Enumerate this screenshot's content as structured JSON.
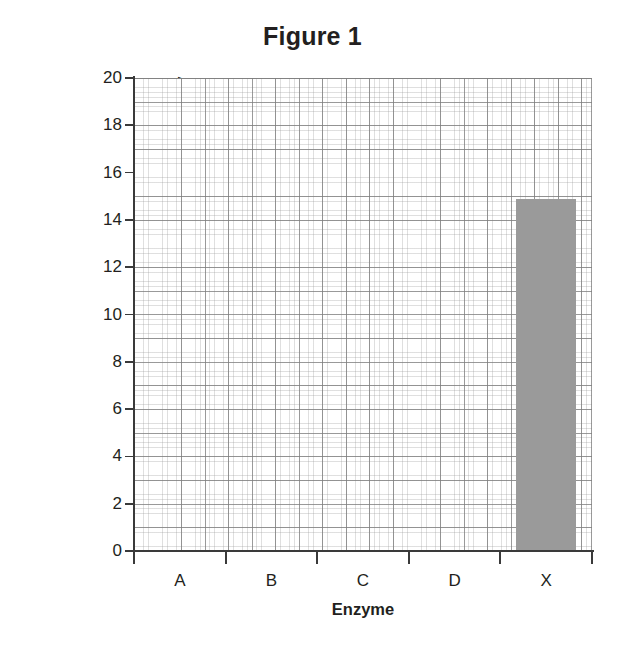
{
  "chart_data": {
    "type": "bar",
    "title": "Figure 1",
    "xlabel": "Enzyme",
    "ylabel": "Time Taken to Completely Digest Protein (min)",
    "ylabel_lines": [
      "Time Taken to Completely",
      "Digest Protein (min)"
    ],
    "categories": [
      "A",
      "B",
      "C",
      "D",
      "X"
    ],
    "values": [
      0,
      0,
      0,
      0,
      14.9
    ],
    "ylim": [
      0,
      20
    ],
    "ytick_labels": [
      "0",
      "2",
      "4",
      "6",
      "8",
      "10",
      "12",
      "14",
      "16",
      "18",
      "20"
    ],
    "ytick_values": [
      0,
      2,
      4,
      6,
      8,
      10,
      12,
      14,
      16,
      18,
      20
    ],
    "y_major_step": 2,
    "grid": "graph-paper, major and minor gridlines",
    "legend": "none",
    "bar_color": "#9a9a9a",
    "axis_color": "#3a3a3a",
    "grid_major_color": "#7d7d7d",
    "grid_minor_color": "#969696",
    "background_color": "#ffffff",
    "text_color": "#231f20"
  }
}
